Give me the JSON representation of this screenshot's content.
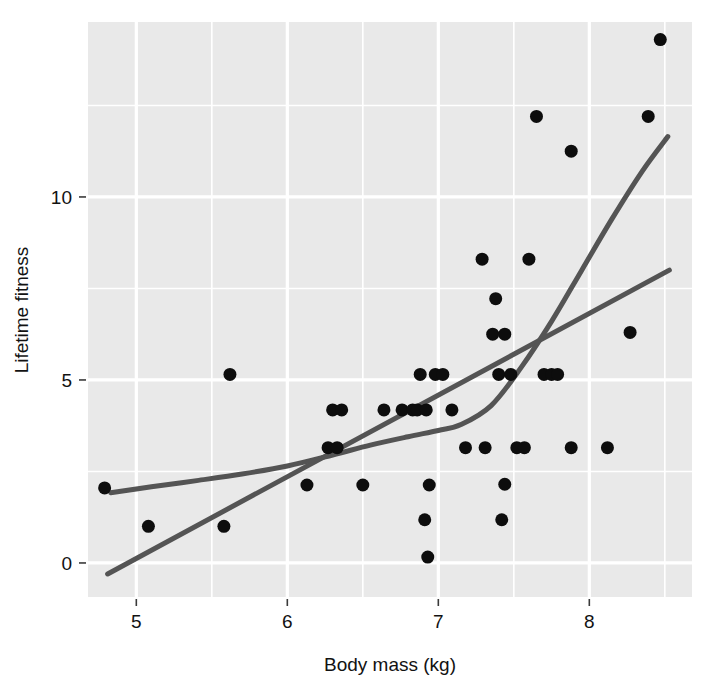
{
  "chart_data": {
    "type": "scatter",
    "title": "",
    "xlabel": "Body mass (kg)",
    "ylabel": "Lifetime fitness",
    "xlim": [
      4.68,
      8.68
    ],
    "ylim": [
      -0.93,
      14.78
    ],
    "xticks": [
      5,
      6,
      7,
      8
    ],
    "xtick_labels": [
      "5",
      "6",
      "7",
      "8"
    ],
    "yticks": [
      0,
      5,
      10
    ],
    "ytick_labels": [
      "0",
      "5",
      "10"
    ],
    "grid": true,
    "grid_major_x": [
      5,
      6,
      7,
      8
    ],
    "grid_minor_x": [
      5.5,
      6.5,
      7.5,
      8.5
    ],
    "grid_major_y": [
      0,
      5,
      10
    ],
    "grid_minor_y": [
      2.5,
      7.5,
      12.5
    ],
    "legend": "none",
    "panel_background": "#e9e9e9",
    "grid_color": "#ffffff",
    "point_color": "#0d0d0d",
    "point_radius": 6.5,
    "line_color": "#545454",
    "line_width": 5,
    "points": [
      {
        "x": 4.79,
        "y": 2.05
      },
      {
        "x": 5.08,
        "y": 1.0
      },
      {
        "x": 5.58,
        "y": 1.0
      },
      {
        "x": 5.62,
        "y": 5.15
      },
      {
        "x": 6.13,
        "y": 2.13
      },
      {
        "x": 6.27,
        "y": 3.15
      },
      {
        "x": 6.33,
        "y": 3.15
      },
      {
        "x": 6.3,
        "y": 4.18
      },
      {
        "x": 6.36,
        "y": 4.18
      },
      {
        "x": 6.5,
        "y": 2.13
      },
      {
        "x": 6.64,
        "y": 4.18
      },
      {
        "x": 6.76,
        "y": 4.18
      },
      {
        "x": 6.83,
        "y": 4.18
      },
      {
        "x": 6.86,
        "y": 4.18
      },
      {
        "x": 6.88,
        "y": 5.15
      },
      {
        "x": 6.92,
        "y": 4.18
      },
      {
        "x": 6.98,
        "y": 5.15
      },
      {
        "x": 7.03,
        "y": 5.15
      },
      {
        "x": 6.94,
        "y": 2.13
      },
      {
        "x": 6.91,
        "y": 1.18
      },
      {
        "x": 6.93,
        "y": 0.16
      },
      {
        "x": 7.09,
        "y": 4.18
      },
      {
        "x": 7.18,
        "y": 3.15
      },
      {
        "x": 7.29,
        "y": 8.3
      },
      {
        "x": 7.31,
        "y": 3.15
      },
      {
        "x": 7.38,
        "y": 7.22
      },
      {
        "x": 7.36,
        "y": 6.25
      },
      {
        "x": 7.4,
        "y": 5.15
      },
      {
        "x": 7.44,
        "y": 6.25
      },
      {
        "x": 7.48,
        "y": 5.15
      },
      {
        "x": 7.44,
        "y": 2.15
      },
      {
        "x": 7.42,
        "y": 1.18
      },
      {
        "x": 7.52,
        "y": 3.15
      },
      {
        "x": 7.57,
        "y": 3.15
      },
      {
        "x": 7.6,
        "y": 8.3
      },
      {
        "x": 7.65,
        "y": 12.2
      },
      {
        "x": 7.7,
        "y": 5.15
      },
      {
        "x": 7.75,
        "y": 5.15
      },
      {
        "x": 7.79,
        "y": 5.15
      },
      {
        "x": 7.88,
        "y": 11.25
      },
      {
        "x": 7.88,
        "y": 3.15
      },
      {
        "x": 8.12,
        "y": 3.15
      },
      {
        "x": 8.27,
        "y": 6.3
      },
      {
        "x": 8.39,
        "y": 12.2
      },
      {
        "x": 8.47,
        "y": 14.3
      }
    ],
    "series": [
      {
        "name": "linear-fit",
        "type": "line",
        "shape": "straight",
        "points": [
          {
            "x": 4.81,
            "y": -0.3
          },
          {
            "x": 8.53,
            "y": 8.0
          }
        ]
      },
      {
        "name": "loess-fit",
        "type": "line",
        "shape": "curved",
        "points": [
          {
            "x": 4.83,
            "y": 1.92
          },
          {
            "x": 5.1,
            "y": 2.08
          },
          {
            "x": 5.4,
            "y": 2.25
          },
          {
            "x": 5.7,
            "y": 2.43
          },
          {
            "x": 6.0,
            "y": 2.65
          },
          {
            "x": 6.3,
            "y": 2.95
          },
          {
            "x": 6.55,
            "y": 3.22
          },
          {
            "x": 6.8,
            "y": 3.45
          },
          {
            "x": 7.0,
            "y": 3.62
          },
          {
            "x": 7.15,
            "y": 3.78
          },
          {
            "x": 7.35,
            "y": 4.3
          },
          {
            "x": 7.55,
            "y": 5.35
          },
          {
            "x": 7.75,
            "y": 6.6
          },
          {
            "x": 7.95,
            "y": 8.0
          },
          {
            "x": 8.15,
            "y": 9.4
          },
          {
            "x": 8.35,
            "y": 10.7
          },
          {
            "x": 8.52,
            "y": 11.65
          }
        ]
      }
    ]
  },
  "axes": {
    "x_title": "Body mass (kg)",
    "y_title": "Lifetime fitness"
  }
}
